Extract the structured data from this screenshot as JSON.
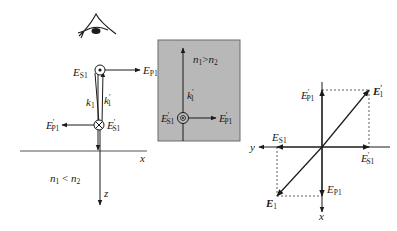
{
  "figure": {
    "left_panel": {
      "observer": "eye-icon",
      "labels": {
        "es1": {
          "main": "E",
          "sub": "S1",
          "prime": ""
        },
        "ep1": {
          "main": "E",
          "sub": "P1",
          "prime": ""
        },
        "k1": {
          "main": "k",
          "sub": "1",
          "prime": ""
        },
        "k1p": {
          "main": "k",
          "sub": "1",
          "prime": "′"
        },
        "ep1p": {
          "main": "E",
          "sub": "P1",
          "prime": "′"
        },
        "es1p": {
          "main": "E",
          "sub": "S1",
          "prime": "′"
        },
        "x_axis": "x",
        "z_axis": "z",
        "medium": {
          "n1": "n",
          "n1_sub": "1",
          "rel": " < ",
          "n2": "n",
          "n2_sub": "2"
        }
      }
    },
    "inset_panel": {
      "background": "#b8b8b8",
      "labels": {
        "medium": {
          "n1": "n",
          "n1_sub": "1",
          "rel": ">",
          "n2": "n",
          "n2_sub": "2"
        },
        "k1p": {
          "main": "k",
          "sub": "1",
          "prime": "′"
        },
        "es1p": {
          "main": "E",
          "sub": "S1",
          "prime": "′"
        },
        "ep1p": {
          "main": "E",
          "sub": "P1",
          "prime": "′"
        }
      }
    },
    "right_panel": {
      "labels": {
        "ep1p": {
          "main": "E",
          "sub": "P1",
          "prime": "′"
        },
        "e1p": {
          "main": "E",
          "sub": "1",
          "prime": "′"
        },
        "es1": {
          "main": "E",
          "sub": "S1",
          "prime": ""
        },
        "es1p": {
          "main": "E",
          "sub": "S1",
          "prime": "′"
        },
        "y_axis": "y",
        "x_axis": "x",
        "e1": {
          "main": "E",
          "sub": "1",
          "prime": ""
        },
        "ep1": {
          "main": "E",
          "sub": "P1",
          "prime": ""
        }
      }
    }
  }
}
